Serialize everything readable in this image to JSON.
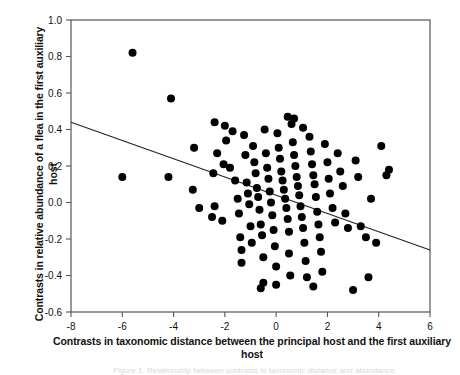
{
  "figure": {
    "ylabel": "Contrasts in relative abundance of a flea in the first auxiliary host",
    "xlabel": "Contrasts in taxonomic distance between the principal host and the first auxiliary host",
    "caption": "Figure 1. Relationship between contrasts in taxonomic distance and abundance."
  },
  "chart_data": {
    "type": "scatter",
    "title": "",
    "xlabel": "Contrasts in taxonomic distance between the principal host and the first auxiliary host",
    "ylabel": "Contrasts in relative abundance of a flea in the first auxiliary host",
    "xlim": [
      -8,
      6
    ],
    "ylim": [
      -0.6,
      1.0
    ],
    "xticks": [
      -8,
      -6,
      -4,
      -2,
      0,
      2,
      4,
      6
    ],
    "xtick_labels": [
      "-8",
      "-6",
      "-4",
      "-2",
      "0",
      "2",
      "4",
      "6"
    ],
    "yticks": [
      -0.6,
      -0.4,
      -0.2,
      0.0,
      0.2,
      0.4,
      0.6,
      0.8,
      1.0
    ],
    "ytick_labels": [
      "-0.6",
      "-0.4",
      "-0.2",
      "0.0",
      "0.2",
      "0.4",
      "0.6",
      "0.8",
      "1.0"
    ],
    "grid": false,
    "legend": false,
    "marker": "filled-circle",
    "marker_color": "#000000",
    "marker_size": 4,
    "trendline": {
      "type": "linear",
      "color": "#222222",
      "x_start": -8,
      "y_start": 0.44,
      "x_end": 6,
      "y_end": -0.26,
      "slope": -0.05,
      "intercept": 0.04
    },
    "points": [
      [
        -5.6,
        0.82
      ],
      [
        -4.1,
        0.57
      ],
      [
        -3.2,
        0.3
      ],
      [
        -3.25,
        0.07
      ],
      [
        -2.4,
        0.44
      ],
      [
        -2.3,
        0.27
      ],
      [
        -2.05,
        0.21
      ],
      [
        -2.45,
        0.16
      ],
      [
        -2.4,
        -0.02
      ],
      [
        -6.0,
        0.14
      ],
      [
        -4.2,
        0.14
      ],
      [
        -3.0,
        -0.03
      ],
      [
        -2.5,
        -0.08
      ],
      [
        -2.1,
        -0.1
      ],
      [
        -1.95,
        0.34
      ],
      [
        -1.8,
        0.19
      ],
      [
        -1.6,
        0.12
      ],
      [
        -1.5,
        0.02
      ],
      [
        -1.45,
        -0.06
      ],
      [
        -1.4,
        -0.19
      ],
      [
        -1.35,
        -0.26
      ],
      [
        -1.35,
        -0.33
      ],
      [
        -1.2,
        0.26
      ],
      [
        -1.15,
        0.11
      ],
      [
        -1.1,
        0.05
      ],
      [
        -1.05,
        -0.01
      ],
      [
        -1.0,
        -0.13
      ],
      [
        -0.95,
        -0.22
      ],
      [
        -0.9,
        0.31
      ],
      [
        -0.85,
        0.22
      ],
      [
        -0.8,
        0.16
      ],
      [
        -0.75,
        0.08
      ],
      [
        -0.7,
        0.03
      ],
      [
        -0.65,
        -0.04
      ],
      [
        -0.6,
        -0.12
      ],
      [
        -0.55,
        -0.18
      ],
      [
        -0.5,
        -0.3
      ],
      [
        -0.5,
        -0.44
      ],
      [
        -0.45,
        0.4
      ],
      [
        -0.4,
        0.27
      ],
      [
        -0.35,
        0.19
      ],
      [
        -0.3,
        0.13
      ],
      [
        -0.25,
        0.06
      ],
      [
        -0.2,
        0.0
      ],
      [
        -0.15,
        -0.07
      ],
      [
        -0.1,
        -0.15
      ],
      [
        -0.05,
        -0.24
      ],
      [
        0.0,
        -0.35
      ],
      [
        0.0,
        -0.45
      ],
      [
        0.05,
        0.38
      ],
      [
        0.1,
        0.3
      ],
      [
        0.15,
        0.24
      ],
      [
        0.2,
        0.17
      ],
      [
        0.25,
        0.12
      ],
      [
        0.3,
        0.07
      ],
      [
        0.35,
        0.02
      ],
      [
        0.4,
        -0.03
      ],
      [
        0.45,
        -0.09
      ],
      [
        0.5,
        -0.16
      ],
      [
        0.5,
        -0.28
      ],
      [
        0.55,
        -0.4
      ],
      [
        0.6,
        0.43
      ],
      [
        0.65,
        0.33
      ],
      [
        0.7,
        0.26
      ],
      [
        0.75,
        0.2
      ],
      [
        0.8,
        0.14
      ],
      [
        0.85,
        0.09
      ],
      [
        0.9,
        0.04
      ],
      [
        0.95,
        -0.02
      ],
      [
        1.0,
        -0.08
      ],
      [
        1.05,
        -0.14
      ],
      [
        1.1,
        -0.22
      ],
      [
        1.15,
        -0.32
      ],
      [
        1.2,
        -0.41
      ],
      [
        1.3,
        0.36
      ],
      [
        1.35,
        0.28
      ],
      [
        1.4,
        0.21
      ],
      [
        1.45,
        0.15
      ],
      [
        1.5,
        0.1
      ],
      [
        1.55,
        0.03
      ],
      [
        1.6,
        -0.05
      ],
      [
        1.65,
        -0.12
      ],
      [
        1.7,
        -0.19
      ],
      [
        1.75,
        -0.27
      ],
      [
        1.8,
        -0.38
      ],
      [
        1.9,
        0.32
      ],
      [
        2.0,
        0.22
      ],
      [
        2.05,
        0.13
      ],
      [
        2.1,
        0.05
      ],
      [
        2.2,
        -0.03
      ],
      [
        2.3,
        -0.11
      ],
      [
        2.4,
        0.27
      ],
      [
        2.5,
        0.17
      ],
      [
        2.6,
        0.09
      ],
      [
        2.7,
        -0.06
      ],
      [
        2.8,
        -0.14
      ],
      [
        3.0,
        -0.48
      ],
      [
        3.1,
        0.23
      ],
      [
        3.2,
        0.14
      ],
      [
        3.3,
        -0.13
      ],
      [
        3.5,
        -0.19
      ],
      [
        3.6,
        -0.41
      ],
      [
        3.7,
        0.02
      ],
      [
        3.9,
        -0.22
      ],
      [
        4.1,
        0.31
      ],
      [
        4.3,
        0.15
      ],
      [
        4.4,
        0.18
      ],
      [
        -2.0,
        0.42
      ],
      [
        -1.7,
        0.39
      ],
      [
        0.45,
        0.47
      ],
      [
        0.7,
        0.46
      ],
      [
        1.05,
        0.41
      ],
      [
        -1.25,
        0.37
      ],
      [
        -0.6,
        -0.47
      ],
      [
        1.45,
        -0.46
      ]
    ]
  }
}
